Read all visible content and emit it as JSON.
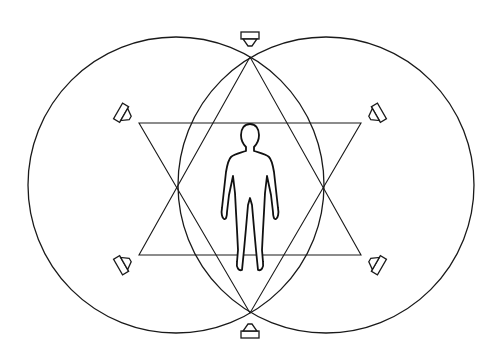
{
  "diagram": {
    "title": "Speaker arrangement around listener",
    "colors": {
      "line": "#1a1a1a",
      "background": "#ffffff"
    },
    "circles": [
      {
        "name": "left-circle",
        "cx": 176,
        "cy": 185,
        "r": 148
      },
      {
        "name": "right-circle",
        "cx": 326,
        "cy": 185,
        "r": 148
      }
    ],
    "triangles": [
      {
        "name": "upward-triangle",
        "points": "250,57 139,255 361,255"
      },
      {
        "name": "downward-triangle",
        "points": "139,123 361,123 250,313"
      }
    ],
    "speakers": [
      {
        "name": "speaker-top",
        "x": 250,
        "y": 40,
        "rotate": 0
      },
      {
        "name": "speaker-bottom",
        "x": 250,
        "y": 330,
        "rotate": 180
      },
      {
        "name": "speaker-upper-left",
        "x": 125,
        "y": 115,
        "rotate": -60
      },
      {
        "name": "speaker-upper-right",
        "x": 375,
        "y": 115,
        "rotate": 60
      },
      {
        "name": "speaker-lower-left",
        "x": 125,
        "y": 263,
        "rotate": -120
      },
      {
        "name": "speaker-lower-right",
        "x": 375,
        "y": 263,
        "rotate": 120
      }
    ],
    "listener": {
      "label": "listener figure",
      "cx": 250,
      "top": 123,
      "bottom": 270
    }
  }
}
